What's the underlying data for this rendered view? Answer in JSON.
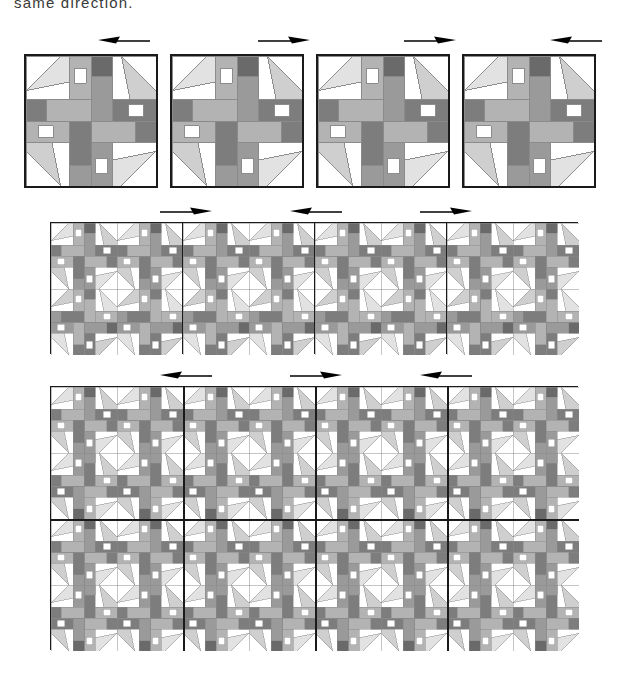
{
  "page": {
    "caption": "same direction.",
    "background": "#ffffff"
  },
  "palette": {
    "white": "#ffffff",
    "light": "#e2e2e2",
    "light2": "#cfcfcf",
    "medium": "#b3b3b3",
    "medium_dark": "#9a9a9a",
    "dark": "#7d7d7d",
    "darkest": "#6a6a6a",
    "outline": "#8a8a8a",
    "border": "#1a1a1a",
    "arrow": "#000000"
  },
  "figure": {
    "type": "quilt-block-layout-diagram",
    "rows": [
      {
        "name": "single-blocks-row",
        "blocks": 4,
        "grid": "1x1",
        "arrows": [
          {
            "index": 0,
            "direction": "left"
          },
          {
            "index": 1,
            "direction": "right"
          },
          {
            "index": 2,
            "direction": "right"
          },
          {
            "index": 3,
            "direction": "left"
          }
        ]
      },
      {
        "name": "joined-row",
        "blocks": 4,
        "grid": "2x2",
        "arrows": [
          {
            "index": 0,
            "direction": "right"
          },
          {
            "index": 1,
            "direction": "left"
          },
          {
            "index": 2,
            "direction": "right"
          }
        ]
      },
      {
        "name": "full-setting",
        "blocks": 16,
        "grid": "4x4",
        "arrows": [
          {
            "index": 0,
            "direction": "left"
          },
          {
            "index": 1,
            "direction": "right"
          },
          {
            "index": 2,
            "direction": "left"
          }
        ]
      }
    ]
  },
  "arrows": {
    "row1": [
      "left",
      "right",
      "right",
      "left"
    ],
    "row2": [
      "right",
      "left",
      "right"
    ],
    "row3": [
      "left",
      "right",
      "left"
    ]
  }
}
